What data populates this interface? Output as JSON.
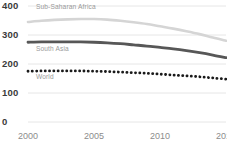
{
  "chart_data": {
    "type": "line",
    "title": "",
    "subtitle": "",
    "xlabel": "",
    "ylabel": "",
    "xlim": [
      2000,
      2015
    ],
    "ylim": [
      0,
      400
    ],
    "grid": "horizontal",
    "legend_position": "inline-labels",
    "x": [
      2000,
      2001,
      2002,
      2003,
      2004,
      2005,
      2006,
      2007,
      2008,
      2009,
      2010,
      2011,
      2012,
      2013,
      2014,
      2015
    ],
    "y_ticks": [
      "0",
      "100",
      "200",
      "300",
      "400"
    ],
    "y_tick_values": [
      0,
      100,
      200,
      300,
      400
    ],
    "x_ticks": [
      "2000",
      "2005",
      "2010",
      "2015"
    ],
    "x_tick_values": [
      2000,
      2005,
      2010,
      2015
    ],
    "series": [
      {
        "name": "Sub-Saharan Africa",
        "color": "#d5d5d5",
        "style": "solid",
        "width": 2.6,
        "label_x": 2000.6,
        "label_y": 392,
        "values": [
          345,
          349,
          352,
          354,
          355,
          355,
          353,
          349,
          344,
          338,
          330,
          322,
          313,
          303,
          291,
          280
        ]
      },
      {
        "name": "South Asia",
        "color": "#575757",
        "style": "solid",
        "width": 2.8,
        "label_x": 2000.6,
        "label_y": 250,
        "values": [
          275,
          276,
          276,
          276,
          276,
          275,
          273,
          270,
          266,
          262,
          257,
          252,
          246,
          239,
          231,
          222
        ]
      },
      {
        "name": "World",
        "color": "#1a1a1a",
        "style": "dotted",
        "width": 2.8,
        "label_x": 2000.6,
        "label_y": 152,
        "values": [
          175,
          176,
          176,
          176,
          176,
          175,
          174,
          172,
          170,
          168,
          165,
          162,
          159,
          156,
          152,
          148
        ]
      }
    ]
  },
  "axis_colors": {
    "grid": "#e6e6e6",
    "y_tick_text": "#3a3a3a",
    "x_tick_text": "#8c8c8c",
    "series_label_text": "#9a9a9a",
    "background": "#ffffff"
  }
}
